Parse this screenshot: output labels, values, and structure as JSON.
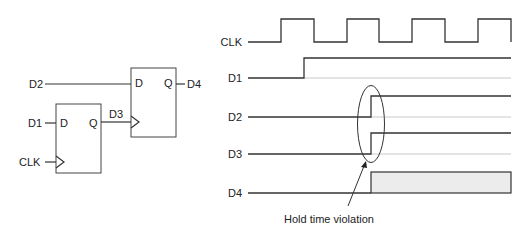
{
  "schematic": {
    "inputs": {
      "d2": "D2",
      "d1": "D1",
      "clk": "CLK"
    },
    "ff1": {
      "d_pin": "D",
      "q_pin": "Q",
      "output_net": "D3"
    },
    "ff2": {
      "d_pin": "D",
      "q_pin": "Q",
      "output_net": "D4"
    }
  },
  "timing": {
    "signals": [
      {
        "name": "CLK"
      },
      {
        "name": "D1"
      },
      {
        "name": "D2"
      },
      {
        "name": "D3"
      },
      {
        "name": "D4"
      }
    ],
    "annotation": "Hold time violation",
    "colors": {
      "line": "#333333",
      "undefined_fill": "#ececec"
    }
  }
}
